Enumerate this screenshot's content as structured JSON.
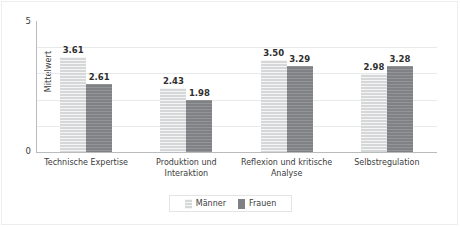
{
  "chart_data": {
    "type": "bar",
    "title": "",
    "subtitle": "",
    "xlabel": "",
    "ylabel": "Mittelwert",
    "ylim": [
      0,
      5
    ],
    "yticks": [
      0,
      5
    ],
    "gridlines": [
      1,
      2,
      3,
      4
    ],
    "grid": true,
    "legend_position": "bottom-center",
    "categories": [
      "Technische Expertise",
      "Produktion und Interaktion",
      "Reflexion und kritische Analyse",
      "Selbstregulation"
    ],
    "category_lines": [
      [
        "Technische Expertise"
      ],
      [
        "Produktion und",
        "Interaktion"
      ],
      [
        "Reflexion und kritische",
        "Analyse"
      ],
      [
        "Selbstregulation"
      ]
    ],
    "series": [
      {
        "name": "Männer",
        "color": "#d6d7d8",
        "values": [
          3.61,
          2.43,
          3.5,
          2.98
        ],
        "labels": [
          "3.61",
          "2.43",
          "3.50",
          "2.98"
        ]
      },
      {
        "name": "Frauen",
        "color": "#7f8184",
        "values": [
          2.61,
          1.98,
          3.29,
          3.28
        ],
        "labels": [
          "2.61",
          "1.98",
          "3.29",
          "3.28"
        ]
      }
    ]
  },
  "axis": {
    "y_top_tick": "5",
    "y_bottom_tick": "0",
    "y_title": "Mittelwert"
  },
  "legend": {
    "items": [
      {
        "label": "Männer",
        "swatch": "light-swatch-icon"
      },
      {
        "label": "Frauen",
        "swatch": "dark-swatch-icon"
      }
    ]
  },
  "colors": {
    "series_light": "#d6d7d8",
    "series_dark": "#7f8184",
    "gridline": "#e8e9ea",
    "axis": "#b9bbbd",
    "text": "#3b3b3b",
    "frame": "#ededee",
    "background": "#ffffff"
  }
}
